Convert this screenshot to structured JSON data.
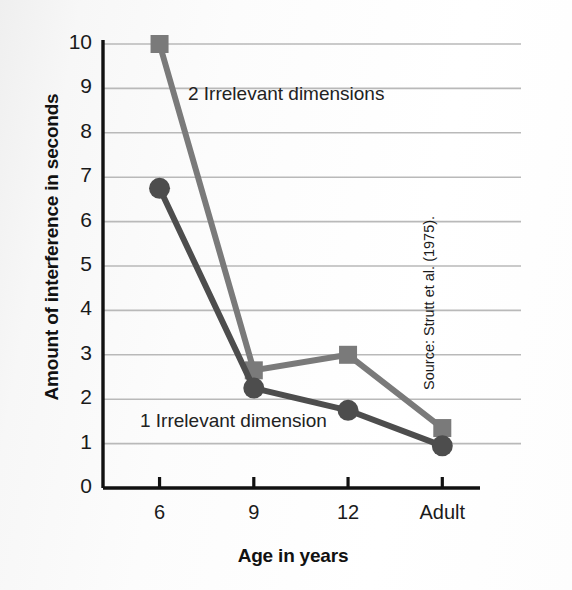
{
  "chart_data": {
    "type": "line",
    "title": "",
    "xlabel": "Age in years",
    "ylabel": "Amount of interference in seconds",
    "categories": [
      "6",
      "9",
      "12",
      "Adult"
    ],
    "ylim": [
      0,
      10
    ],
    "ytick_labels": [
      "0",
      "1",
      "2",
      "3",
      "4",
      "5",
      "6",
      "7",
      "8",
      "9",
      "10"
    ],
    "grid": true,
    "gridlines_at": [
      1,
      2,
      3,
      4,
      5,
      6,
      7,
      8,
      9,
      10
    ],
    "legend_position": "inline-annotations",
    "series": [
      {
        "name": "2 Irrelevant dimensions",
        "marker": "square",
        "color": "#7a7a7a",
        "values": [
          10.0,
          2.65,
          3.0,
          1.35
        ]
      },
      {
        "name": "1 Irrelevant dimension",
        "marker": "circle",
        "color": "#4d4d4d",
        "values": [
          6.75,
          2.25,
          1.75,
          0.95
        ]
      }
    ],
    "annotations": [
      {
        "text": "2 Irrelevant dimensions",
        "near": "upper-series"
      },
      {
        "text": "1 Irrelevant dimension",
        "near": "lower-series"
      }
    ],
    "source": "Source: Strutt et al. (1975)."
  },
  "colors": {
    "axis": "#111111",
    "grid": "#b9b9b9",
    "series_two_irrelevant": "#7a7a7a",
    "series_one_irrelevant": "#4d4d4d",
    "text": "#1a1a1a",
    "background": "#fbfbfb"
  }
}
